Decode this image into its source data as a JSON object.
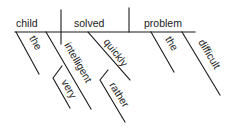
{
  "diagram": {
    "type": "Reed-Kellogg sentence diagram",
    "sentence_parts": {
      "subject": "child",
      "verb": "solved",
      "object": "problem"
    },
    "modifiers": {
      "subject_article": "the",
      "subject_adjective": "intelligent",
      "adjective_adverb": "very",
      "verb_adverb": "quickly",
      "adverb_adverb": "rather",
      "object_article": "the",
      "object_adjective": "difficult"
    }
  }
}
